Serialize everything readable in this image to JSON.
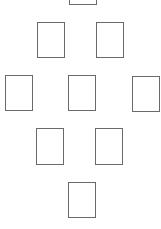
{
  "diagram": {
    "type": "card-spread",
    "layout": "diamond",
    "border_color": "#6a6a6a",
    "background": "#ffffff",
    "cards": [
      {
        "id": 1,
        "x": 69,
        "y": -31,
        "w": 28,
        "h": 36
      },
      {
        "id": 2,
        "x": 37,
        "y": 22,
        "w": 28,
        "h": 36
      },
      {
        "id": 3,
        "x": 96,
        "y": 22,
        "w": 28,
        "h": 36
      },
      {
        "id": 4,
        "x": 5,
        "y": 75,
        "w": 28,
        "h": 36
      },
      {
        "id": 5,
        "x": 68,
        "y": 75,
        "w": 28,
        "h": 36
      },
      {
        "id": 6,
        "x": 132,
        "y": 76,
        "w": 28,
        "h": 36
      },
      {
        "id": 7,
        "x": 36,
        "y": 128,
        "w": 28,
        "h": 37
      },
      {
        "id": 8,
        "x": 95,
        "y": 128,
        "w": 28,
        "h": 37
      },
      {
        "id": 9,
        "x": 68,
        "y": 182,
        "w": 28,
        "h": 36
      }
    ]
  }
}
